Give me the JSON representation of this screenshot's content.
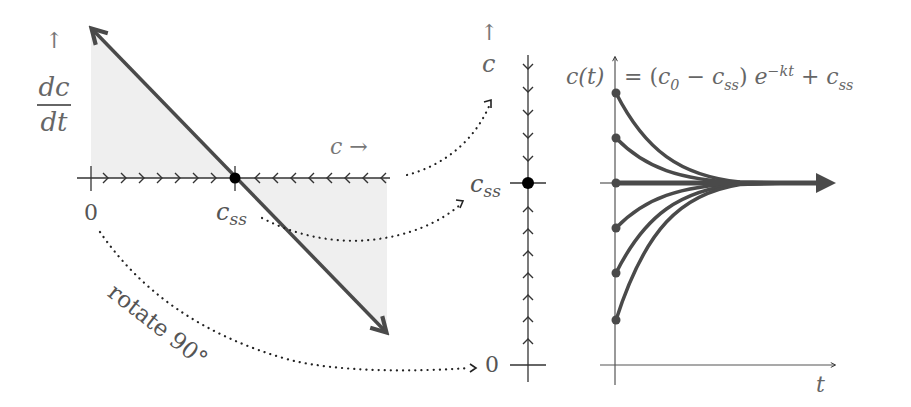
{
  "figure": {
    "left_panel": {
      "y_axis_arrow": "↑",
      "y_label_numerator": "dc",
      "y_label_denominator": "dt",
      "x_label": "c →",
      "origin_label": "0",
      "steady_state_label": "css",
      "flow_left_of_css": "right (increasing c)",
      "flow_right_of_css": "left (decreasing c)"
    },
    "middle_panel": {
      "axis_arrow": "↑",
      "axis_label": "c",
      "steady_state_label": "css",
      "origin_label": "0",
      "flow_above_css": "down",
      "flow_below_css": "up"
    },
    "right_panel": {
      "formula_lhs": "c(t)",
      "formula_rhs": "= (c0 − css) e^(−kt) + css",
      "x_label": "t"
    },
    "annotation": {
      "rotate_label": "rotate 90°"
    }
  },
  "colors": {
    "line": "#4a4a4a",
    "shade": "#ececec",
    "text": "#555555",
    "dot": "#000000"
  }
}
